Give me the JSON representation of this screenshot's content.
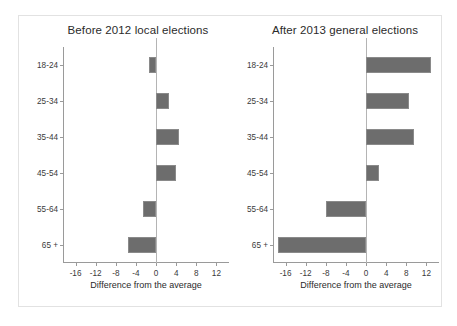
{
  "figure": {
    "background_color": "#ffffff",
    "frame_color": "#e2e2e2",
    "bar_color": "#6d6d6d",
    "axis_color": "#9a9a9a"
  },
  "chart_data": [
    {
      "type": "bar",
      "orientation": "horizontal",
      "title": "Before 2012 local elections",
      "xlabel": "Difference from the average",
      "ylabel": "",
      "categories": [
        "18-24",
        "25-34",
        "35-44",
        "45-54",
        "55-64",
        "65 +"
      ],
      "values": [
        -1.5,
        2.5,
        4.5,
        4.0,
        -2.5,
        -5.5
      ],
      "xticks": [
        -16,
        -12,
        -8,
        -4,
        0,
        4,
        8,
        12
      ],
      "xtick_labels": [
        "-16",
        "-12",
        "-8",
        "-4",
        "0",
        "4",
        "8",
        "12"
      ],
      "xlim": [
        -18.5,
        14.5
      ],
      "grid": false,
      "legend": "none",
      "zero_reference_line": true
    },
    {
      "type": "bar",
      "orientation": "horizontal",
      "title": "After 2013 general elections",
      "xlabel": "Difference from the average",
      "ylabel": "",
      "categories": [
        "18-24",
        "25-34",
        "35-44",
        "45-54",
        "55-64",
        "65 +"
      ],
      "values": [
        13.0,
        8.5,
        9.5,
        2.5,
        -8.0,
        -17.5
      ],
      "xticks": [
        -16,
        -12,
        -8,
        -4,
        0,
        4,
        8,
        12
      ],
      "xtick_labels": [
        "-16",
        "-12",
        "-8",
        "-4",
        "0",
        "4",
        "8",
        "12"
      ],
      "xlim": [
        -18.5,
        14.5
      ],
      "grid": false,
      "legend": "none",
      "zero_reference_line": true
    }
  ]
}
